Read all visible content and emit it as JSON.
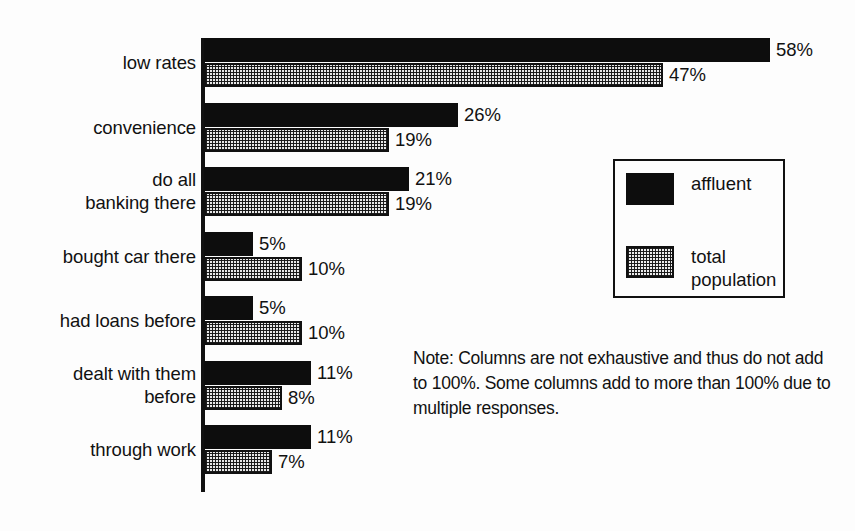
{
  "chart_data": {
    "type": "bar",
    "orientation": "horizontal",
    "title": "",
    "xlabel": "",
    "ylabel": "",
    "xlim": [
      0,
      58
    ],
    "grid": false,
    "legend_position": "right",
    "categories": [
      "low rates",
      "convenience",
      "do all\nbanking there",
      "bought car there",
      "had loans before",
      "dealt with them\nbefore",
      "through work"
    ],
    "series": [
      {
        "name": "affluent",
        "color": "#0d0d0d",
        "values": [
          58,
          26,
          21,
          5,
          5,
          11,
          11
        ],
        "labels": [
          "58%",
          "26%",
          "21%",
          "5%",
          "5%",
          "11%",
          "11%"
        ]
      },
      {
        "name": "total population",
        "color": "#e8e8e8",
        "values": [
          47,
          19,
          19,
          10,
          10,
          8,
          7
        ],
        "labels": [
          "47%",
          "19%",
          "19%",
          "10%",
          "10%",
          "8%",
          "7%"
        ]
      }
    ],
    "note": "Note: Columns are not exhaustive and thus do not add to 100%. Some columns add to more than 100% due to multiple responses."
  },
  "legend": {
    "items": [
      {
        "label": "affluent",
        "swatch": "solid-black-swatch"
      },
      {
        "label": "total\npopulation",
        "swatch": "dotted-gray-swatch"
      }
    ]
  }
}
